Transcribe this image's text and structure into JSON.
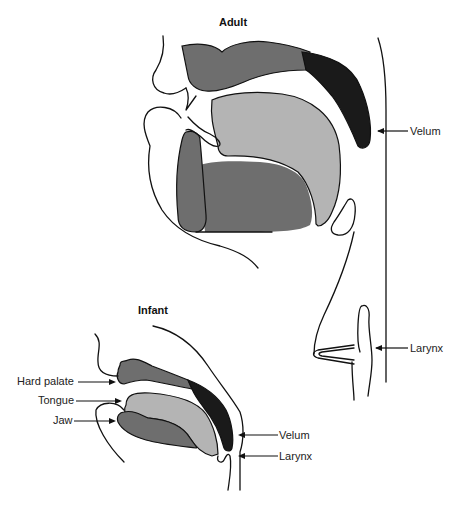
{
  "figure": {
    "adult": {
      "title": "Adult",
      "labels": {
        "velum": "Velum",
        "larynx": "Larynx"
      }
    },
    "infant": {
      "title": "Infant",
      "labels": {
        "hard_palate": "Hard palate",
        "tongue": "Tongue",
        "jaw": "Jaw",
        "velum": "Velum",
        "larynx": "Larynx"
      }
    },
    "colors": {
      "hard_palate": "#6e6e6e",
      "velum": "#1a1a1a",
      "tongue": "#b4b4b4",
      "jaw": "#6e6e6e",
      "outline": "#111111",
      "background": "#ffffff"
    }
  }
}
